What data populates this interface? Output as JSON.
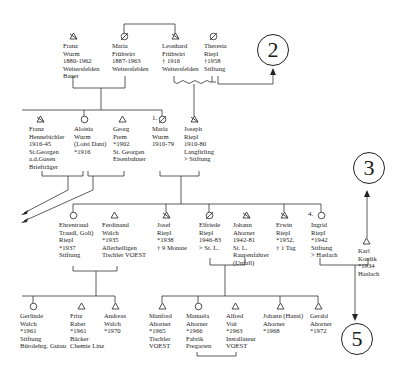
{
  "diagram": {
    "type": "genealogy-tree",
    "references": [
      {
        "id": "ref2",
        "label": "2"
      },
      {
        "id": "ref3",
        "label": "3"
      },
      {
        "id": "ref5",
        "label": "5"
      }
    ],
    "generation1": [
      {
        "id": "franz_wurm",
        "symbol": "triangle-deceased",
        "lines": [
          "Franz",
          "Wurm",
          "1880-1962",
          "Weitersfelden",
          "Bauer"
        ]
      },
      {
        "id": "maria_fruhwirt",
        "symbol": "circle-deceased",
        "lines": [
          "Maria",
          "Frühwirt",
          "1887-1963",
          "Weitersfelden"
        ]
      },
      {
        "id": "leonhard_fruhwirt",
        "symbol": "triangle-deceased",
        "lines": [
          "Leonhard",
          "Frühwirt",
          "† 1916",
          "Weitersfelden"
        ]
      },
      {
        "id": "theresia_riepl",
        "symbol": "circle-deceased",
        "lines": [
          "Theresia",
          "Riepl",
          "†1958",
          "Stiftung"
        ]
      }
    ],
    "generation2": [
      {
        "id": "franz_hennebichler",
        "symbol": "triangle-deceased",
        "lines": [
          "Franz",
          "Hennebichler",
          "1916-45",
          "St.Georgen",
          "a.d.Gusen",
          "Briefträger"
        ]
      },
      {
        "id": "aloisia_wurm",
        "symbol": "circle",
        "lines": [
          "Aloisia",
          "Wurm",
          "(Loisi Dant)",
          "*1916"
        ]
      },
      {
        "id": "georg_prem",
        "symbol": "triangle",
        "lines": [
          "Georg",
          "Prem",
          "*1902",
          "St. Georgen",
          "Eisenbahner"
        ]
      },
      {
        "id": "maria_wurm",
        "symbol": "circle-deceased",
        "prefix": "1.",
        "lines": [
          "Maria",
          "Wurm",
          "1910-79"
        ]
      },
      {
        "id": "joseph_riepl",
        "symbol": "triangle-deceased",
        "lines": [
          "Joseph",
          "Riepl",
          "1910-80",
          "Langfirling",
          "> Stiftung"
        ]
      }
    ],
    "generation3": [
      {
        "id": "ehrentraud_riepl",
        "symbol": "circle",
        "lines": [
          "Ehrentraud",
          "Traudl, Goli)",
          "Riepl",
          "*1937",
          "Stiftung"
        ]
      },
      {
        "id": "ferdinand_walch",
        "symbol": "triangle",
        "lines": [
          "Ferdinand",
          "Walch",
          "*1935",
          "Allerheiligen",
          "Tischler VOEST"
        ]
      },
      {
        "id": "josef_riepl",
        "symbol": "triangle-deceased",
        "lines": [
          "Josef",
          "Riepl",
          "*1938",
          "† 9 Monate"
        ]
      },
      {
        "id": "elfriede_riepl",
        "symbol": "circle-deceased",
        "lines": [
          "Elfriede",
          "Riepl",
          "1946-83",
          "> St. L."
        ]
      },
      {
        "id": "johann_ahorner",
        "symbol": "triangle-deceased",
        "lines": [
          "Johann",
          "Ahorner",
          "1942-81",
          "St. L.",
          "Raupenfahrer",
          "(Unfall)"
        ]
      },
      {
        "id": "erwin_riepl",
        "symbol": "triangle-deceased",
        "lines": [
          "Erwin",
          "Riepl",
          "*1952,",
          "† 1 Tag"
        ]
      },
      {
        "id": "ingrid_riepl",
        "symbol": "circle",
        "prefix": "4.",
        "lines": [
          "Ingrid",
          "Riepl",
          "*1942",
          "Stiftung",
          "> Haslach"
        ]
      },
      {
        "id": "karl_kordik",
        "symbol": "triangle",
        "lines": [
          "Karl",
          "Kordik",
          "*1934",
          "Haslach"
        ]
      }
    ],
    "generation4": [
      {
        "id": "gerlinde_walch",
        "symbol": "circle",
        "lines": [
          "Gerlinde",
          "Walch",
          "*1961",
          "Stiftung",
          "Bürolehrg. Gutau"
        ]
      },
      {
        "id": "fritz_raber",
        "symbol": "triangle",
        "lines": [
          "Fritz",
          "Raber",
          "*1961",
          "Bäcker",
          "Chemie Linz"
        ]
      },
      {
        "id": "andreas_walch",
        "symbol": "triangle",
        "lines": [
          "Andreas",
          "Walch",
          "*1970"
        ]
      },
      {
        "id": "manfred_ahorner",
        "symbol": "triangle",
        "lines": [
          "Manfred",
          "Ahorner",
          "*1965",
          "Tischler",
          "VOEST"
        ]
      },
      {
        "id": "manuela_ahorner",
        "symbol": "circle",
        "lines": [
          "Manuela",
          "Ahorner",
          "*1966",
          "Fabrik",
          "Pregarten"
        ]
      },
      {
        "id": "alfred_voit",
        "symbol": "triangle",
        "lines": [
          "Alfred",
          "Voit",
          "*1963",
          "Installateur",
          "VOEST"
        ]
      },
      {
        "id": "johann_hansi_ahorner",
        "symbol": "triangle",
        "lines": [
          "Johann (Hansi)",
          "Ahorner",
          "*1968"
        ]
      },
      {
        "id": "gerald_ahorner",
        "symbol": "triangle",
        "lines": [
          "Gerald",
          "Ahorner",
          "*1972"
        ]
      }
    ]
  },
  "colors": {
    "line": "#333333",
    "text": "#1a1a1a",
    "background": "#ffffff"
  }
}
